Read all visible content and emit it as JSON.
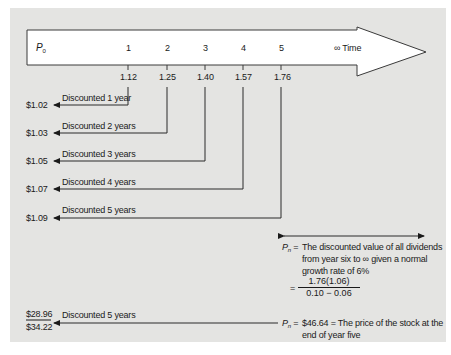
{
  "diagram": {
    "start_label": "P",
    "start_subscript": "0",
    "time_label": "∞ Time",
    "years": [
      {
        "year": "1",
        "dividend": "1.12",
        "discount_label": "Discounted 1 year",
        "present_value": "$1.02"
      },
      {
        "year": "2",
        "dividend": "1.25",
        "discount_label": "Discounted 2 years",
        "present_value": "$1.03"
      },
      {
        "year": "3",
        "dividend": "1.40",
        "discount_label": "Discounted 3 years",
        "present_value": "$1.05"
      },
      {
        "year": "4",
        "dividend": "1.57",
        "discount_label": "Discounted 4 years",
        "present_value": "$1.07"
      },
      {
        "year": "5",
        "dividend": "1.76",
        "discount_label": "Discounted 5 years",
        "present_value": "$1.09"
      }
    ],
    "pn_definition": {
      "symbol": "P",
      "subscript": "n",
      "equals": "=",
      "line1": "The discounted value of all dividends",
      "line2": "from year six to ∞ given a normal",
      "line3": "growth rate of 6%",
      "formula_numerator": "1.76(1.06)",
      "formula_denominator": "0.10 − 0.06"
    },
    "pn_result": {
      "symbol": "P",
      "subscript": "n",
      "equals": "=",
      "line1": "$46.64 = The price of the stock at the",
      "line2": "end of year five"
    },
    "final": {
      "discount_label": "Discounted 5 years",
      "discounted_value": "$28.96",
      "total_value": "$34.22"
    }
  }
}
